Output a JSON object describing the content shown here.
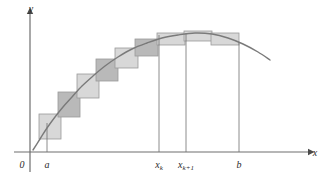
{
  "figure": {
    "name": "riemann-sum-midpoint-rectangles"
  },
  "axes": {
    "x_axis_label": "x",
    "y_axis_label": "y",
    "origin_label": "0"
  },
  "tick_labels": [
    {
      "id": "a",
      "text": "a",
      "sub": "",
      "x": 47
    },
    {
      "id": "xk",
      "text": "x",
      "sub": "k",
      "x": 159
    },
    {
      "id": "xk1",
      "text": "x",
      "sub": "k+1",
      "x": 186
    },
    {
      "id": "b",
      "text": "b",
      "sub": "",
      "x": 239
    }
  ],
  "colors": {
    "curve": "#7a7a7a",
    "axis": "#6e6e6e",
    "rect_light": "#d8d8d8",
    "rect_dark": "#b9b9b9",
    "rect_stroke": "#9a9a9a",
    "text": "#2b2b2b",
    "background": "#ffffff"
  },
  "chart_data": {
    "type": "area",
    "title": "",
    "xlabel": "x",
    "ylabel": "y",
    "grid": false,
    "legend": null,
    "axis_origin_px": {
      "x": 30,
      "y": 152
    },
    "x_axis_end_px": 308,
    "y_axis_top_px": 14,
    "curve_description": "smooth concave-down curve rising steeply from lower-left, peaking near x=200px, then descending to the right edge",
    "curve_points_px": [
      [
        33,
        150
      ],
      [
        40,
        139
      ],
      [
        47,
        128
      ],
      [
        55,
        117
      ],
      [
        63,
        107
      ],
      [
        72,
        97
      ],
      [
        82,
        86
      ],
      [
        93,
        76
      ],
      [
        105,
        66
      ],
      [
        118,
        57
      ],
      [
        132,
        49
      ],
      [
        147,
        43
      ],
      [
        162,
        38
      ],
      [
        178,
        35
      ],
      [
        195,
        33
      ],
      [
        212,
        34
      ],
      [
        228,
        38
      ],
      [
        243,
        44
      ],
      [
        258,
        52
      ],
      [
        270,
        60
      ]
    ],
    "rectangles_px": [
      {
        "index": 1,
        "x": 39,
        "y": 114,
        "w": 22,
        "h": 25,
        "shade": "light"
      },
      {
        "index": 2,
        "x": 58,
        "y": 92,
        "w": 22,
        "h": 25,
        "shade": "dark"
      },
      {
        "index": 3,
        "x": 77,
        "y": 74,
        "w": 22,
        "h": 24,
        "shade": "light"
      },
      {
        "index": 4,
        "x": 96,
        "y": 59,
        "w": 22,
        "h": 22,
        "shade": "dark"
      },
      {
        "index": 5,
        "x": 115,
        "y": 48,
        "w": 23,
        "h": 20,
        "shade": "light"
      },
      {
        "index": 6,
        "x": 135,
        "y": 39,
        "w": 23,
        "h": 17,
        "shade": "dark"
      },
      {
        "index": 7,
        "x": 157,
        "y": 33,
        "w": 28,
        "h": 12,
        "shade": "light"
      },
      {
        "index": 8,
        "x": 184,
        "y": 31,
        "w": 28,
        "h": 10,
        "shade": "light"
      },
      {
        "index": 9,
        "x": 211,
        "y": 33,
        "w": 28,
        "h": 12,
        "shade": "light"
      }
    ],
    "vertical_lines_px": [
      {
        "id": "a-line",
        "x": 47,
        "y_top": 123,
        "y_bottom": 152
      },
      {
        "id": "xk-line",
        "x": 159,
        "y_top": 35,
        "y_bottom": 152
      },
      {
        "id": "xk1-line",
        "x": 186,
        "y_top": 33,
        "y_bottom": 152
      },
      {
        "id": "b-line",
        "x": 239,
        "y_top": 42,
        "y_bottom": 152
      }
    ]
  }
}
